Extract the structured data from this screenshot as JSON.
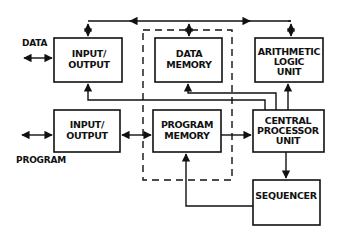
{
  "diagram": {
    "blocks": {
      "io_top": [
        "INPUT/",
        "OUTPUT"
      ],
      "data_memory": [
        "DATA",
        "MEMORY"
      ],
      "alu": [
        "ARITHMETIC",
        "LOGIC",
        "UNIT"
      ],
      "io_bottom": [
        "INPUT/",
        "OUTPUT"
      ],
      "program_memory": [
        "PROGRAM",
        "MEMORY"
      ],
      "cpu": [
        "CENTRAL",
        "PROCESSOR",
        "UNIT"
      ],
      "sequencer": [
        "SEQUENCER"
      ]
    },
    "external_labels": {
      "data": "DATA",
      "program": "PROGRAM"
    }
  }
}
